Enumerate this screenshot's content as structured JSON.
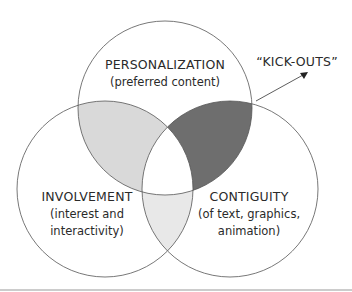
{
  "diagram": {
    "type": "venn",
    "circles": [
      {
        "id": "personalization",
        "title": "PERSONALIZATION",
        "subtitle_lines": [
          "(preferred content)"
        ]
      },
      {
        "id": "involvement",
        "title": "INVOLVEMENT",
        "subtitle_lines": [
          "(interest and",
          "interactivity)"
        ]
      },
      {
        "id": "contiguity",
        "title": "CONTIGUITY",
        "subtitle_lines": [
          "(of text, graphics,",
          "animation)"
        ]
      }
    ],
    "annotation": {
      "label": "“KICK-OUTS”",
      "points_to": "personalization ∩ contiguity"
    },
    "colors": {
      "stroke": "#555555",
      "personalization_involvement": "#d9d9d9",
      "personalization_contiguity": "#6e6e6e",
      "involvement_contiguity": "#e8e8e8",
      "center": "#ffffff",
      "bottom_rule": "#9a9a9a"
    }
  }
}
